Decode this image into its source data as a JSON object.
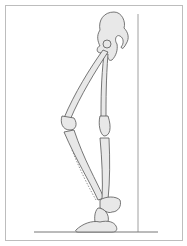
{
  "figure": {
    "elements": {
      "pelvis": "pelvis-icon",
      "femur_front": "femur-icon",
      "femur_back": "femur-icon",
      "tibia_front": "tibia-icon",
      "tibia_back": "tibia-icon",
      "foot": "foot-icon",
      "wall_line": "vertical-reference-line",
      "ground_line": "ground-line",
      "dotted_line": "dotted-reference-line"
    },
    "colors": {
      "bone_fill": "#e8e8e8",
      "outline": "#555555",
      "frame": "#bdbdbd",
      "line": "#888888"
    }
  }
}
